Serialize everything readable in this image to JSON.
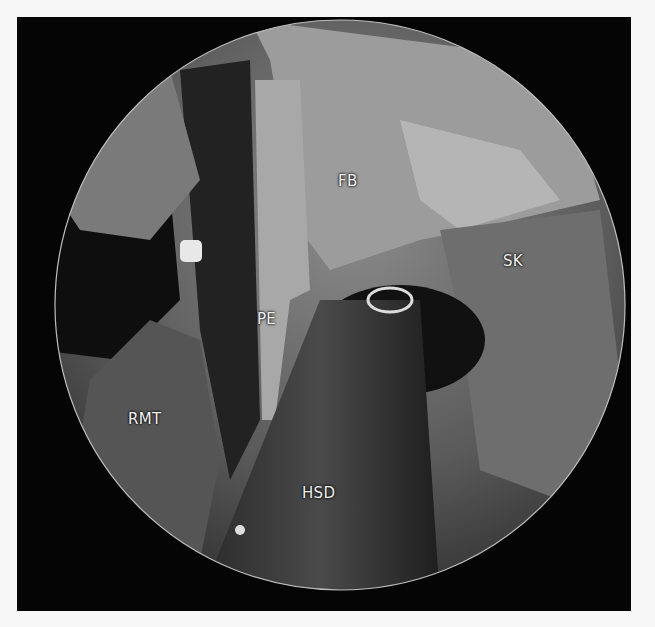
{
  "figure": {
    "type": "endoscopic surgical view",
    "labels": [
      {
        "id": "FB",
        "text": "FB",
        "x": 338,
        "y": 172
      },
      {
        "id": "SK",
        "text": "SK",
        "x": 503,
        "y": 252
      },
      {
        "id": "PE",
        "text": "PE",
        "x": 257,
        "y": 310
      },
      {
        "id": "RMT",
        "text": "RMT",
        "x": 128,
        "y": 410
      },
      {
        "id": "HSD",
        "text": "HSD",
        "x": 302,
        "y": 484
      }
    ]
  }
}
